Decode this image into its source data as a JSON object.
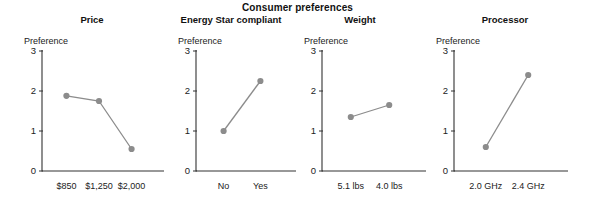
{
  "chart_data": {
    "type": "line",
    "title": "Consumer preferences",
    "ylabel": "Preference",
    "ylim": [
      0,
      3
    ],
    "yticks": [
      "0",
      "1",
      "2",
      "3"
    ],
    "grid": false,
    "legend": "none",
    "marker": "circle",
    "series_color": "#8c8c8c",
    "axis_color": "#333333",
    "panels": [
      {
        "title": "Price",
        "ylabel": "Preference",
        "categories": [
          "$850",
          "$1,250",
          "$2,000"
        ],
        "values": [
          1.88,
          1.75,
          0.55
        ]
      },
      {
        "title": "Energy Star compliant",
        "ylabel": "Preference",
        "categories": [
          "No",
          "Yes"
        ],
        "values": [
          1.0,
          2.25
        ]
      },
      {
        "title": "Weight",
        "ylabel": "Preference",
        "categories": [
          "5.1 lbs",
          "4.0 lbs"
        ],
        "values": [
          1.35,
          1.65
        ]
      },
      {
        "title": "Processor",
        "ylabel": "Preference",
        "categories": [
          "2.0 GHz",
          "2.4 GHz"
        ],
        "values": [
          0.6,
          2.4
        ]
      }
    ]
  }
}
